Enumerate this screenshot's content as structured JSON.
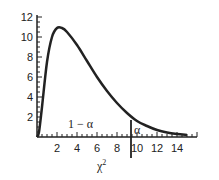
{
  "chart_data": {
    "type": "line",
    "title": "",
    "xlabel": "χ²",
    "ylabel": "",
    "xlim": [
      0,
      16
    ],
    "ylim": [
      0,
      12
    ],
    "x_ticks": [
      2,
      4,
      6,
      8,
      10,
      12,
      14
    ],
    "y_ticks": [
      2,
      4,
      6,
      8,
      10,
      12
    ],
    "grid": false,
    "series": [
      {
        "name": "chi-square density",
        "x": [
          0.2,
          0.5,
          1,
          1.5,
          2,
          2.5,
          3,
          4,
          5,
          6,
          7,
          8,
          9,
          10,
          11,
          12,
          13,
          14,
          15
        ],
        "values": [
          0.5,
          3,
          7.5,
          10,
          10.9,
          10.9,
          10.5,
          9.2,
          7.6,
          6.0,
          4.6,
          3.4,
          2.4,
          1.6,
          1.1,
          0.7,
          0.45,
          0.3,
          0.2
        ]
      }
    ],
    "annotations": [
      {
        "text": "1 − α",
        "x": 4.5,
        "y": 1.2,
        "meaning": "area left of critical value"
      },
      {
        "text": "α",
        "x": 10,
        "y": 0.5,
        "meaning": "tail area right of critical value"
      },
      {
        "type": "vertical_line",
        "x": 9.4,
        "label": "critical value"
      }
    ]
  },
  "labels": {
    "xlabel": "χ",
    "xlabel_sup": "2",
    "one_minus_alpha": "1 − α",
    "alpha": "α",
    "xticks": [
      "2",
      "4",
      "6",
      "8",
      "10",
      "12",
      "14"
    ],
    "yticks": [
      "2",
      "4",
      "6",
      "8",
      "10",
      "12"
    ]
  }
}
